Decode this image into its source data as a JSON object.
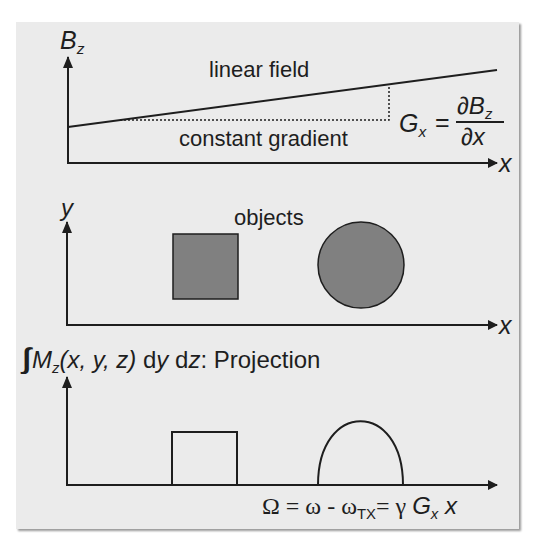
{
  "figure": {
    "background_color": "#ebebeb",
    "line_color": "#1e1e1e",
    "object_fill_color": "#808080",
    "top_panel": {
      "y_axis_label": "B",
      "y_axis_label_subscript": "z",
      "x_axis_label": "x",
      "linear_field_label": "linear field",
      "constant_gradient_label": "constant gradient",
      "gradient_formula": {
        "lhs": "G",
        "lhs_subscript": "x",
        "equals": "=",
        "numerator": "∂B",
        "numerator_subscript": "z",
        "denominator": "∂x"
      }
    },
    "middle_panel": {
      "y_axis_label": "y",
      "x_axis_label": "x",
      "objects_label": "objects",
      "objects": [
        {
          "shape": "square",
          "name": "square-object"
        },
        {
          "shape": "circle",
          "name": "circle-object"
        }
      ]
    },
    "bottom_panel": {
      "projection_label": {
        "integral": "∫∫",
        "function": "M",
        "function_subscript": "z",
        "args": "(x, y, z)",
        "d1": "d",
        "v1": "y",
        "d2": "d",
        "v2": "z",
        "suffix": ": Projection"
      },
      "x_axis_formula": {
        "omega_cap": "Ω = ω - ω",
        "omega_sub": "TX",
        "rest": "= γ ",
        "g": "G",
        "g_sub": "x",
        "x": " x"
      },
      "profiles": [
        {
          "shape": "rectangle",
          "from": "square-object"
        },
        {
          "shape": "semi-ellipse",
          "from": "circle-object"
        }
      ]
    }
  }
}
